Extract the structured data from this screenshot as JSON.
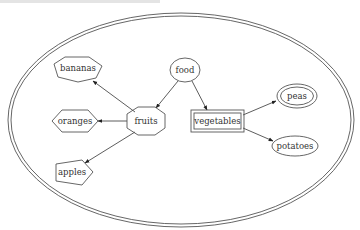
{
  "diagram": {
    "type": "graph",
    "cluster": {
      "shape": "double-ellipse",
      "color": "#555555"
    },
    "nodes": [
      {
        "id": "food",
        "label": "food",
        "shape": "ellipse"
      },
      {
        "id": "fruits",
        "label": "fruits",
        "shape": "octagon"
      },
      {
        "id": "vegetables",
        "label": "vegetables",
        "shape": "double-box"
      },
      {
        "id": "bananas",
        "label": "bananas",
        "shape": "septagon"
      },
      {
        "id": "oranges",
        "label": "oranges",
        "shape": "hexagon"
      },
      {
        "id": "apples",
        "label": "apples",
        "shape": "pentagon"
      },
      {
        "id": "peas",
        "label": "peas",
        "shape": "double-circle"
      },
      {
        "id": "potatoes",
        "label": "potatoes",
        "shape": "ellipse"
      }
    ],
    "edges": [
      {
        "from": "food",
        "to": "fruits"
      },
      {
        "from": "food",
        "to": "vegetables"
      },
      {
        "from": "fruits",
        "to": "bananas"
      },
      {
        "from": "fruits",
        "to": "oranges"
      },
      {
        "from": "fruits",
        "to": "apples"
      },
      {
        "from": "vegetables",
        "to": "peas"
      },
      {
        "from": "vegetables",
        "to": "potatoes"
      }
    ]
  },
  "labels": {
    "food": "food",
    "fruits": "fruits",
    "vegetables": "vegetables",
    "bananas": "bananas",
    "oranges": "oranges",
    "apples": "apples",
    "peas": "peas",
    "potatoes": "potatoes"
  }
}
